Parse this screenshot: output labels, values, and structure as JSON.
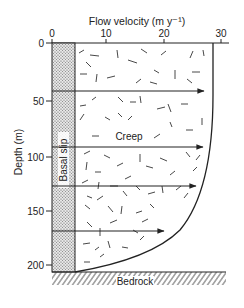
{
  "diagram": {
    "title": "Flow velocity (m y⁻¹)",
    "x_axis": {
      "label": "Flow velocity (m y⁻¹)",
      "ticks": [
        {
          "value": 0,
          "label": "0"
        },
        {
          "value": 10,
          "label": "10"
        },
        {
          "value": 20,
          "label": "20"
        },
        {
          "value": 30,
          "label": "30"
        }
      ],
      "range": [
        0,
        30
      ]
    },
    "y_axis": {
      "label": "Depth (m)",
      "ticks": [
        {
          "value": 0,
          "label": "0"
        },
        {
          "value": 50,
          "label": "50"
        },
        {
          "value": 100,
          "label": "100"
        },
        {
          "value": 150,
          "label": "150"
        },
        {
          "value": 200,
          "label": "200"
        }
      ],
      "range": [
        0,
        210
      ]
    },
    "labels": {
      "creep": "Creep",
      "basal_slip": "Basal slip",
      "bedrock": "Bedrock"
    },
    "basal_slip_velocity": 4,
    "surface_velocity": 29,
    "velocity_arrows": [
      {
        "depth": 42,
        "velocity": 28.5
      },
      {
        "depth": 92,
        "velocity": 28.3
      },
      {
        "depth": 130,
        "velocity": 27.5
      },
      {
        "depth": 172,
        "velocity": 20.7
      }
    ],
    "colors": {
      "line": "#222222",
      "basal_fill": "#cfcfcf",
      "background": "#ffffff"
    }
  }
}
